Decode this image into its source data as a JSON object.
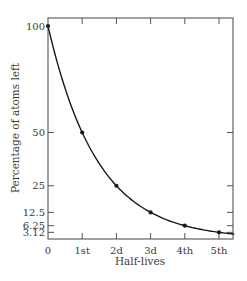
{
  "chart_data": {
    "type": "line",
    "title": "",
    "xlabel": "Half-lives",
    "ylabel": "Percentage of atoms left",
    "categories": [
      "0",
      "1st",
      "2d",
      "3d",
      "4th",
      "5th"
    ],
    "x": [
      0,
      1,
      2,
      3,
      4,
      5
    ],
    "values": [
      100,
      50,
      25,
      12.5,
      6.25,
      3.12
    ],
    "series": [
      {
        "name": "Percentage of atoms left",
        "values": [
          100,
          50,
          25,
          12.5,
          6.25,
          3.12
        ]
      }
    ],
    "y_ticks": [
      {
        "value": 100,
        "label": "100"
      },
      {
        "value": 50,
        "label": "50"
      },
      {
        "value": 25,
        "label": "25"
      },
      {
        "value": 12.5,
        "label": "12.5"
      },
      {
        "value": 6.25,
        "label": "6.25"
      },
      {
        "value": 3.12,
        "label": "3.12"
      }
    ],
    "x_ticks": [
      {
        "value": 0,
        "label": "0"
      },
      {
        "value": 1,
        "label": "1st"
      },
      {
        "value": 2,
        "label": "2d"
      },
      {
        "value": 3,
        "label": "3d"
      },
      {
        "value": 4,
        "label": "4th"
      },
      {
        "value": 5,
        "label": "5th"
      }
    ],
    "ylim": [
      0,
      100
    ],
    "xlim": [
      0,
      5.4
    ],
    "grid": false,
    "legend": "none",
    "frame": "box with mirrored inward ticks on top and right",
    "line_color": "#1a1a1a",
    "axis_color": "#555555"
  }
}
